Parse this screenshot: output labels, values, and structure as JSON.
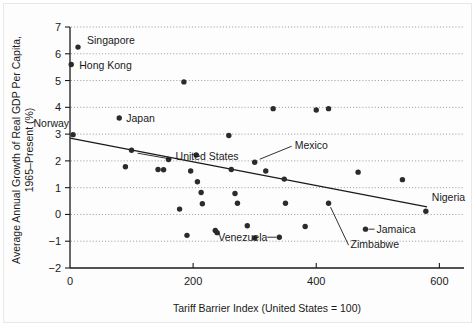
{
  "chart_data": {
    "type": "scatter",
    "title": "",
    "xlabel": "Tariff Barrier Index (United States = 100)",
    "ylabel_line1": "Average Annual Growth of Real GDP Per Capita,",
    "ylabel_line2": "1965–Present (%)",
    "xlim": [
      0,
      640
    ],
    "ylim": [
      -2,
      7
    ],
    "xticks": [
      0,
      200,
      400,
      600
    ],
    "xticklabels": [
      "0",
      "200",
      "400",
      "600"
    ],
    "yticks": [
      -2,
      -1,
      0,
      1,
      2,
      3,
      4,
      5,
      6,
      7
    ],
    "yticklabels": [
      "−2",
      "−1",
      "0",
      "1",
      "2",
      "3",
      "4",
      "5",
      "6",
      "7"
    ],
    "grid": "horizontal-dotted",
    "legend": "none",
    "marker_color": "#2b2b2b",
    "trendline": {
      "label": "fitted regression line",
      "x_start": 0,
      "y_start": 2.85,
      "x_end": 580,
      "y_end": 0.28
    },
    "points": [
      {
        "name": "Singapore",
        "x": 13,
        "y": 6.25,
        "labeled": true
      },
      {
        "name": "Hong Kong",
        "x": 2,
        "y": 5.6,
        "labeled": true
      },
      {
        "name": "Norway",
        "x": 5,
        "y": 2.98,
        "labeled": true
      },
      {
        "name": "Japan",
        "x": 80,
        "y": 3.6,
        "labeled": true
      },
      {
        "name": "United States",
        "x": 100,
        "y": 2.4,
        "labeled": true
      },
      {
        "name": "Mexico",
        "x": 300,
        "y": 1.95,
        "labeled": true
      },
      {
        "name": "Venezuela",
        "x": 340,
        "y": -0.85,
        "labeled": true
      },
      {
        "name": "Zimbabwe",
        "x": 420,
        "y": 0.42,
        "labeled": true
      },
      {
        "name": "Jamaica",
        "x": 480,
        "y": -0.55,
        "labeled": true
      },
      {
        "name": "Nigeria",
        "x": 578,
        "y": 0.12,
        "labeled": true
      },
      {
        "name": "",
        "x": 185,
        "y": 4.95,
        "labeled": false
      },
      {
        "name": "",
        "x": 330,
        "y": 3.95,
        "labeled": false
      },
      {
        "name": "",
        "x": 400,
        "y": 3.9,
        "labeled": false
      },
      {
        "name": "",
        "x": 420,
        "y": 3.95,
        "labeled": false
      },
      {
        "name": "",
        "x": 90,
        "y": 1.78,
        "labeled": false
      },
      {
        "name": "",
        "x": 160,
        "y": 2.05,
        "labeled": false
      },
      {
        "name": "",
        "x": 143,
        "y": 1.68,
        "labeled": false
      },
      {
        "name": "",
        "x": 152,
        "y": 1.67,
        "labeled": false
      },
      {
        "name": "",
        "x": 196,
        "y": 1.62,
        "labeled": false
      },
      {
        "name": "",
        "x": 205,
        "y": 2.22,
        "labeled": false
      },
      {
        "name": "",
        "x": 207,
        "y": 1.22,
        "labeled": false
      },
      {
        "name": "",
        "x": 213,
        "y": 0.82,
        "labeled": false
      },
      {
        "name": "",
        "x": 215,
        "y": 0.4,
        "labeled": false
      },
      {
        "name": "",
        "x": 236,
        "y": -0.6,
        "labeled": false
      },
      {
        "name": "",
        "x": 239,
        "y": -0.68,
        "labeled": false
      },
      {
        "name": "",
        "x": 178,
        "y": 0.2,
        "labeled": false
      },
      {
        "name": "",
        "x": 190,
        "y": -0.78,
        "labeled": false
      },
      {
        "name": "",
        "x": 262,
        "y": 1.68,
        "labeled": false
      },
      {
        "name": "",
        "x": 268,
        "y": 0.78,
        "labeled": false
      },
      {
        "name": "",
        "x": 272,
        "y": 0.42,
        "labeled": false
      },
      {
        "name": "",
        "x": 288,
        "y": -0.42,
        "labeled": false
      },
      {
        "name": "",
        "x": 300,
        "y": -0.88,
        "labeled": false
      },
      {
        "name": "",
        "x": 318,
        "y": 1.62,
        "labeled": false
      },
      {
        "name": "",
        "x": 348,
        "y": 1.32,
        "labeled": false
      },
      {
        "name": "",
        "x": 350,
        "y": 0.42,
        "labeled": false
      },
      {
        "name": "",
        "x": 382,
        "y": -0.45,
        "labeled": false
      },
      {
        "name": "",
        "x": 468,
        "y": 1.58,
        "labeled": false
      },
      {
        "name": "",
        "x": 540,
        "y": 1.3,
        "labeled": false
      },
      {
        "name": "",
        "x": 258,
        "y": 2.95,
        "labeled": false
      }
    ],
    "annotations": [
      {
        "text": "Singapore",
        "kind": "point-label"
      },
      {
        "text": "Hong Kong",
        "kind": "point-label"
      },
      {
        "text": "Norway",
        "kind": "point-label"
      },
      {
        "text": "Japan",
        "kind": "point-label"
      },
      {
        "text": "United States",
        "kind": "point-label-leader"
      },
      {
        "text": "Mexico",
        "kind": "point-label-leader"
      },
      {
        "text": "Venezuela",
        "kind": "point-label-leader"
      },
      {
        "text": "Zimbabwe",
        "kind": "point-label-leader"
      },
      {
        "text": "Jamaica",
        "kind": "point-label-leader"
      },
      {
        "text": "Nigeria",
        "kind": "point-label"
      }
    ]
  }
}
